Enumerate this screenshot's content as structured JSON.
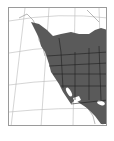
{
  "map": {
    "type": "range-map",
    "region": "Western North America",
    "colors": {
      "range_fill": "#5a5a5a",
      "land_background": "#ffffff",
      "graticule": "#b0b0b0",
      "borders": "#1e1e1e",
      "frame": "#9a9a9a"
    }
  }
}
